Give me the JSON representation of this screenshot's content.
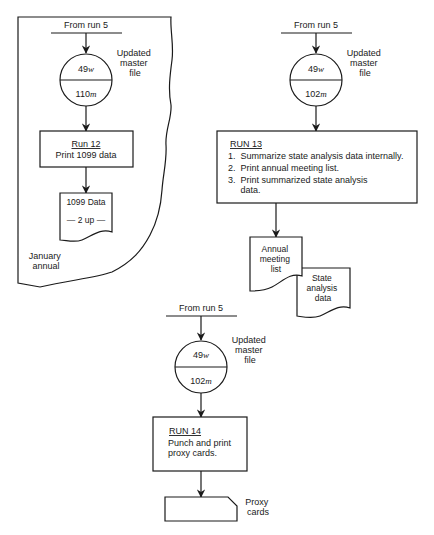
{
  "diagram": {
    "type": "system-flowchart",
    "panels": [
      {
        "id": "run12",
        "frame_note": [
          "January",
          "annual"
        ],
        "source_label": "From run 5",
        "storage": {
          "top": "49",
          "top_unit": "w",
          "bottom": "110",
          "bottom_unit": "m",
          "label": [
            "Updated",
            "master",
            "file"
          ]
        },
        "process": {
          "title": "Run 12",
          "lines": [
            "Print 1099 data"
          ]
        },
        "outputs": [
          {
            "shape": "document",
            "lines": [
              "1099 Data",
              "— 2 up —"
            ]
          }
        ]
      },
      {
        "id": "run13",
        "source_label": "From run 5",
        "storage": {
          "top": "49",
          "top_unit": "w",
          "bottom": "102",
          "bottom_unit": "m",
          "label": [
            "Updated",
            "master",
            "file"
          ]
        },
        "process": {
          "title": "RUN 13",
          "lines": [
            "1.  Summarize state analysis data internally.",
            "2.  Print annual meeting list.",
            "3.  Print summarized state analysis",
            "     data."
          ]
        },
        "outputs": [
          {
            "shape": "document",
            "lines": [
              "Annual",
              "meeting",
              "list"
            ]
          },
          {
            "shape": "document",
            "lines": [
              "State",
              "analysis",
              "data"
            ]
          }
        ]
      },
      {
        "id": "run14",
        "source_label": "From run 5",
        "storage": {
          "top": "49",
          "top_unit": "w",
          "bottom": "102",
          "bottom_unit": "m",
          "label": [
            "Updated",
            "master",
            "file"
          ]
        },
        "process": {
          "title": "RUN 14",
          "lines": [
            "Punch and print",
            "proxy cards."
          ]
        },
        "outputs": [
          {
            "shape": "punched-card",
            "label": [
              "Proxy",
              "cards"
            ]
          }
        ]
      }
    ]
  }
}
